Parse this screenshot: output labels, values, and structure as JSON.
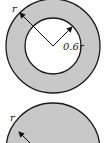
{
  "figures": [
    {
      "name": "annulus",
      "shape": "ring",
      "outer_radius_label": "r",
      "inner_radius_label": "0.6r",
      "fill_color": "#c8c8c8",
      "inner_fill_color": "#ffffff",
      "stroke_color": "#1a1a1a"
    },
    {
      "name": "solid-disc",
      "shape": "disc",
      "radius_label": "r",
      "fill_color": "#c8c8c8",
      "stroke_color": "#1a1a1a"
    }
  ]
}
